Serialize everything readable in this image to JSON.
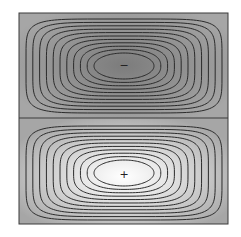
{
  "figure": {
    "panels": [
      {
        "name": "top-cell",
        "sign_label": "−",
        "center_color": "#7a7a7a",
        "edge_color": "#a8a8a8",
        "contour_count": 11
      },
      {
        "name": "bottom-cell",
        "sign_label": "+",
        "center_color": "#ffffff",
        "edge_color": "#a8a8a8",
        "contour_count": 11
      }
    ],
    "colors": {
      "line": "#2a2a2a",
      "border": "#3a3a3a",
      "background": "#ffffff"
    }
  }
}
